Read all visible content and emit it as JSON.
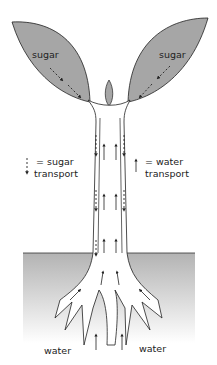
{
  "diagram": {
    "labels": {
      "leaf_left": "sugar",
      "leaf_right": "sugar",
      "legend_sugar_line1": "= sugar",
      "legend_sugar_line2": "transport",
      "legend_water_line1": "= water",
      "legend_water_line2": "transport",
      "root_left": "water",
      "root_right": "water"
    },
    "colors": {
      "leaf_fill": "#a6a6a6",
      "outline": "#2a2a2a",
      "ground_top": "#b5b5b5",
      "ground_bottom": "#ffffff"
    }
  }
}
